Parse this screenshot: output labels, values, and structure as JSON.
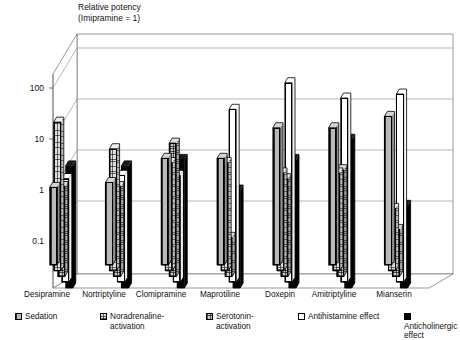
{
  "chart_data": {
    "type": "bar",
    "title": "Relative potency\n(Imipramine = 1)",
    "title_line1": "Relative potency",
    "title_line2": "(Imipramine = 1)",
    "xlabel": "",
    "ylabel": "Relative potency (Imipramine = 1)",
    "yscale": "log",
    "ylim": [
      0.05,
      300
    ],
    "yticks": [
      0.1,
      1,
      10,
      100
    ],
    "ytick_labels": [
      "0.1",
      "1",
      "10",
      "100"
    ],
    "grid": true,
    "grid_axis": "y",
    "legend_position": "bottom",
    "projection": "3d",
    "categories": [
      "Desipramine",
      "Nortriptyline",
      "Clomipramine",
      "Maprotiline",
      "Doxepin",
      "Amitriptyline",
      "Mianserin"
    ],
    "series": [
      {
        "name": "Sedation",
        "pattern": "vertical-hatch",
        "color": "#b9b9b9",
        "values": [
          0.4,
          0.5,
          1.5,
          1.5,
          6,
          6,
          10
        ]
      },
      {
        "name": "Noradrenaline-activation",
        "pattern": "fine-cross-hatch",
        "color": "#dedede",
        "values": [
          10,
          3,
          1.6,
          1.6,
          1.0,
          1.0,
          0.2
        ]
      },
      {
        "name": "Serotonin-activation",
        "pattern": "dense-cross-hatch",
        "color": "#c9c9c9",
        "values": [
          0.7,
          0.7,
          5,
          0.07,
          1.0,
          1.5,
          0.1
        ]
      },
      {
        "name": "Antihistamine effect",
        "pattern": "solid-white",
        "color": "#ffffff",
        "values": [
          1.3,
          1.5,
          1.5,
          30,
          100,
          50,
          60
        ]
      },
      {
        "name": "Anticholinergic effect",
        "pattern": "solid-black",
        "color": "#000000",
        "values": [
          3,
          3,
          4,
          1.0,
          4,
          10,
          0.5
        ]
      }
    ]
  },
  "legend": {
    "items": [
      {
        "label": "Sedation",
        "swatch": "sedation-swatch"
      },
      {
        "label": "Noradrenaline-\nactivation",
        "swatch": "noradrenaline-swatch"
      },
      {
        "label": "Serotonin-\nactivation",
        "swatch": "serotonin-swatch"
      },
      {
        "label": "Antihistamine effect",
        "swatch": "antihistamine-swatch"
      },
      {
        "label": "Anticholinergic effect",
        "swatch": "anticholinergic-swatch"
      }
    ]
  }
}
